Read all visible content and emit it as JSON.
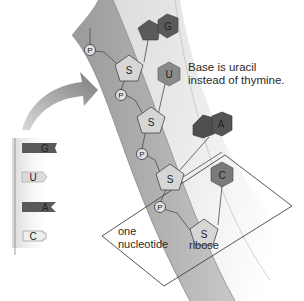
{
  "diagram": {
    "annotation": {
      "line1": "Base is uracil",
      "line2": "instead of thymine."
    },
    "labels": {
      "nucleotide_line1": "one",
      "nucleotide_line2": "nucleotide",
      "ribose": "ribose"
    },
    "legend_bases": [
      {
        "symbol": "G",
        "shade": "dark"
      },
      {
        "symbol": "U",
        "shade": "light"
      },
      {
        "symbol": "A",
        "shade": "dark"
      },
      {
        "symbol": "C",
        "shade": "light"
      }
    ],
    "backbone": {
      "phosphate_symbol": "P",
      "sugar_symbol": "S"
    },
    "strand_bases": [
      {
        "symbol": "G",
        "type": "purine"
      },
      {
        "symbol": "U",
        "type": "pyrimidine"
      },
      {
        "symbol": "A",
        "type": "purine"
      },
      {
        "symbol": "C",
        "type": "pyrimidine"
      }
    ],
    "colors": {
      "dark_base": "#5a5a5a",
      "light_base": "#8a8a8a",
      "sugar_fill": "#d6d6d6",
      "band": "#a9a9a9",
      "arrow": "#8c8c8c"
    }
  }
}
